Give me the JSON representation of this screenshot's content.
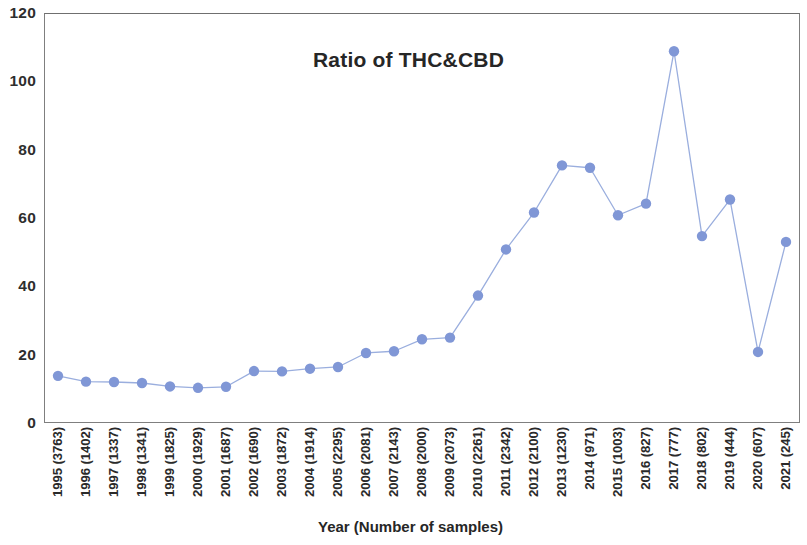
{
  "chart_data": {
    "type": "line",
    "title": "Ratio of THC&CBD",
    "xlabel": "Year (Number of samples)",
    "ylabel": "",
    "ylim": [
      0,
      120
    ],
    "yticks": [
      0,
      20,
      40,
      60,
      80,
      100,
      120
    ],
    "grid": false,
    "legend": null,
    "marker": "circle",
    "series_color": "#8097d6",
    "line_color": "#9aaede",
    "categories": [
      "1995 (3763)",
      "1996 (1402)",
      "1997 (1337)",
      "1998 (1341)",
      "1999 (1825)",
      "2000 (1929)",
      "2001 (1687)",
      "2002 (1690)",
      "2003 (1872)",
      "2004 (1914)",
      "2005 (2295)",
      "2006 (2081)",
      "2007 (2143)",
      "2008 (2000)",
      "2009 (2073)",
      "2010 (2261)",
      "2011 (2342)",
      "2012 (2100)",
      "2013 (1230)",
      "2014 (971)",
      "2015 (1003)",
      "2016 (827)",
      "2017 (777)",
      "2018 (802)",
      "2019 (444)",
      "2020 (607)",
      "2021 (245)"
    ],
    "years": [
      1995,
      1996,
      1997,
      1998,
      1999,
      2000,
      2001,
      2002,
      2003,
      2004,
      2005,
      2006,
      2007,
      2008,
      2009,
      2010,
      2011,
      2012,
      2013,
      2014,
      2015,
      2016,
      2017,
      2018,
      2019,
      2020,
      2021
    ],
    "sample_counts": [
      3763,
      1402,
      1337,
      1341,
      1825,
      1929,
      1687,
      1690,
      1872,
      1914,
      2295,
      2081,
      2143,
      2000,
      2073,
      2261,
      2342,
      2100,
      1230,
      971,
      1003,
      827,
      777,
      802,
      444,
      607,
      245
    ],
    "values": [
      13.8,
      12.1,
      12.0,
      11.7,
      10.7,
      10.3,
      10.6,
      15.2,
      15.1,
      15.9,
      16.4,
      20.5,
      21.0,
      24.5,
      25.0,
      37.3,
      50.8,
      61.6,
      75.4,
      74.7,
      60.8,
      64.2,
      108.8,
      54.7,
      65.4,
      20.8,
      53.0
    ]
  }
}
